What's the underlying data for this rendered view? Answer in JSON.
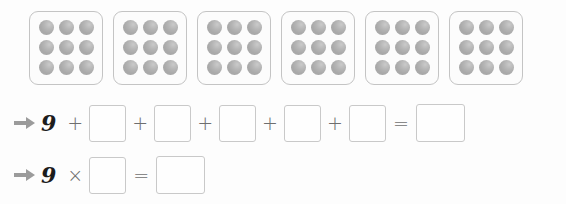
{
  "worksheet": {
    "type": "repeated-addition-to-multiplication",
    "dots_per_box": 9,
    "box_count": 6,
    "dot_color": "#a9a9a9",
    "box_border_color": "#c4c4c4",
    "arrow_color": "#999999",
    "background": "#fdfdfd",
    "dot_boxes": [
      {
        "dots": 9,
        "rows": 3,
        "cols": 3
      },
      {
        "dots": 9,
        "rows": 3,
        "cols": 3
      },
      {
        "dots": 9,
        "rows": 3,
        "cols": 3
      },
      {
        "dots": 9,
        "rows": 3,
        "cols": 3
      },
      {
        "dots": 9,
        "rows": 3,
        "cols": 3
      },
      {
        "dots": 9,
        "rows": 3,
        "cols": 3
      }
    ]
  },
  "equations": {
    "addition": {
      "arrow": "arrow-right-icon",
      "first_operand": "9",
      "plus": "+",
      "equals": "=",
      "blank_value": "",
      "addend_blanks": 5
    },
    "multiplication": {
      "arrow": "arrow-right-icon",
      "first_operand": "9",
      "times": "×",
      "equals": "=",
      "blank_value": ""
    }
  }
}
